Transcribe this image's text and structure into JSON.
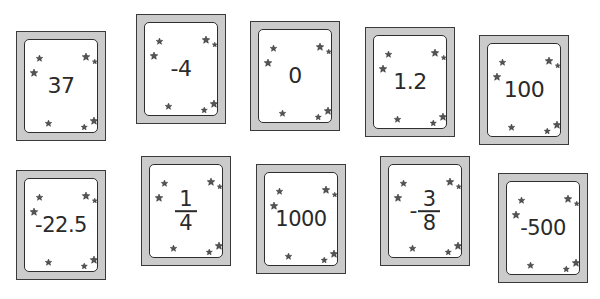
{
  "cards": [
    {
      "type": "number",
      "text": "37",
      "left": 16,
      "top": 31
    },
    {
      "type": "number",
      "text": "-4",
      "left": 136,
      "top": 14
    },
    {
      "type": "number",
      "text": "0",
      "left": 250,
      "top": 21
    },
    {
      "type": "number",
      "text": "1.2",
      "left": 365,
      "top": 27
    },
    {
      "type": "number",
      "text": "100",
      "left": 479,
      "top": 35
    },
    {
      "type": "number",
      "text": "-22.5",
      "left": 16,
      "top": 170
    },
    {
      "type": "fraction",
      "sign": "",
      "numerator": "1",
      "denominator": "4",
      "left": 141,
      "top": 156
    },
    {
      "type": "number",
      "text": "1000",
      "left": 256,
      "top": 164
    },
    {
      "type": "fraction",
      "sign": "-",
      "numerator": "3",
      "denominator": "8",
      "left": 380,
      "top": 156
    },
    {
      "type": "number",
      "text": "-500",
      "left": 498,
      "top": 173
    }
  ],
  "colors": {
    "card_frame": "#cbcbcb",
    "card_outline": "#3a3a3a",
    "card_face": "#ffffff",
    "text": "#2a2a2a",
    "star": "#555555"
  },
  "decoration": {
    "star_icon": "star-icon",
    "stars_per_card": 8
  }
}
